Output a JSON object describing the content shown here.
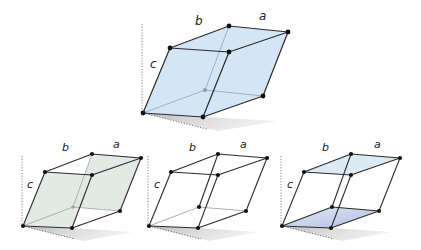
{
  "colors": {
    "edge": "#2b2b2b",
    "vertex": "#111111",
    "guide": "#555555",
    "shadow": "#c9c9c9",
    "fill_full_cell": "#cfe2f5",
    "fill_face_ac": "#e2e8e4",
    "fill_face_ab": "#c2cde8",
    "hidden_edge": "#7a8aa0"
  },
  "diagrams": [
    {
      "id": "unit-cell-main",
      "highlight": "whole-cell",
      "labels": {
        "a": "a",
        "b": "b",
        "c": "c"
      }
    },
    {
      "id": "unit-cell-face-ac",
      "highlight": "a-c face",
      "labels": {
        "a": "a",
        "b": "b",
        "c": "c"
      }
    },
    {
      "id": "unit-cell-face-bc",
      "highlight": "b-c face",
      "labels": {
        "a": "a",
        "b": "b",
        "c": "c"
      }
    },
    {
      "id": "unit-cell-face-ab",
      "highlight": "a-b face",
      "labels": {
        "a": "a",
        "b": "b",
        "c": "c"
      }
    }
  ]
}
